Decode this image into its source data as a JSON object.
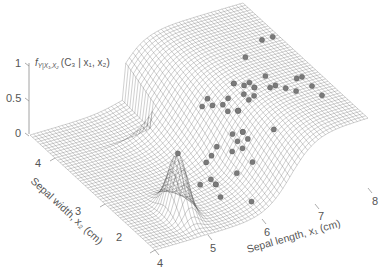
{
  "chart_data": {
    "type": "surface3d",
    "title": "",
    "zlabel": "f_{Y|X1,X2}(C3 | x1, x2)",
    "xlabel": "Sepal length, x1 (cm)",
    "ylabel": "Sepal width, x2 (cm)",
    "x_ticks": [
      "4",
      "5",
      "6",
      "7",
      "8"
    ],
    "y_ticks": [
      "2",
      "3",
      "4"
    ],
    "z_ticks": [
      "0",
      "0.5",
      "1"
    ],
    "xlim": [
      4,
      8
    ],
    "ylim": [
      2,
      4.5
    ],
    "zlim": [
      0,
      1
    ],
    "grid": false,
    "surface": "wireframe mesh of posterior probability for class C3 (virginica); near 0 for x1 < ~5.5, rising to ~1 for x1 > ~6.5",
    "scatter": {
      "name": "class C3 samples",
      "color": "#808080",
      "points": [
        [
          6.3,
          3.3
        ],
        [
          5.8,
          2.7
        ],
        [
          7.1,
          3.0
        ],
        [
          6.3,
          2.9
        ],
        [
          6.5,
          3.0
        ],
        [
          7.6,
          3.0
        ],
        [
          4.9,
          2.5
        ],
        [
          7.3,
          2.9
        ],
        [
          6.7,
          2.5
        ],
        [
          7.2,
          3.6
        ],
        [
          6.5,
          3.2
        ],
        [
          6.4,
          2.7
        ],
        [
          6.8,
          3.0
        ],
        [
          5.7,
          2.5
        ],
        [
          5.8,
          2.8
        ],
        [
          6.4,
          3.2
        ],
        [
          6.5,
          3.0
        ],
        [
          7.7,
          3.8
        ],
        [
          7.7,
          2.6
        ],
        [
          6.0,
          2.2
        ],
        [
          6.9,
          3.2
        ],
        [
          5.6,
          2.8
        ],
        [
          7.7,
          2.8
        ],
        [
          6.3,
          2.7
        ],
        [
          6.7,
          3.3
        ],
        [
          7.2,
          3.2
        ],
        [
          6.2,
          2.8
        ],
        [
          6.1,
          3.0
        ],
        [
          6.4,
          2.8
        ],
        [
          7.2,
          3.0
        ],
        [
          7.4,
          2.8
        ],
        [
          7.9,
          3.8
        ],
        [
          6.4,
          2.8
        ],
        [
          6.3,
          2.8
        ],
        [
          6.1,
          2.6
        ],
        [
          7.7,
          3.0
        ],
        [
          6.3,
          3.4
        ],
        [
          6.4,
          3.1
        ],
        [
          6.0,
          3.0
        ],
        [
          6.9,
          3.1
        ],
        [
          6.7,
          3.1
        ],
        [
          6.9,
          3.1
        ],
        [
          5.8,
          2.7
        ],
        [
          6.8,
          3.2
        ],
        [
          6.7,
          3.3
        ],
        [
          6.7,
          3.0
        ],
        [
          6.3,
          2.5
        ],
        [
          6.5,
          3.0
        ],
        [
          6.2,
          3.4
        ],
        [
          5.9,
          3.0
        ]
      ]
    }
  },
  "colors": {
    "mesh_line": "#4a4a4a",
    "marker_fill": "#7a7a7a",
    "marker_edge": "#5a5a5a",
    "text": "#555555",
    "axis": "#888888"
  },
  "labels": {
    "z_axis": "f",
    "z_axis_sub": "Y|X₁,X₂",
    "z_axis_rest": "(C₃ | x₁, x₂)",
    "x_axis": "Sepal length, x₁ (cm)",
    "y_axis": "Sepal width, x₂ (cm)"
  }
}
